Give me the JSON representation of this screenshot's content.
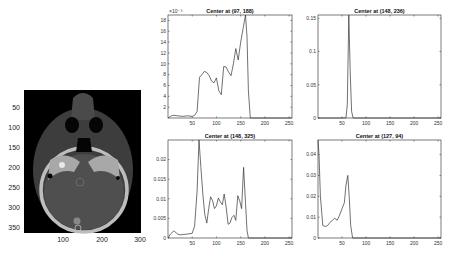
{
  "figure": {
    "image_panel": {
      "y_ticks": [
        "50",
        "100",
        "150",
        "200",
        "250",
        "300",
        "350"
      ],
      "x_ticks": [
        "100",
        "200",
        "300"
      ],
      "colormap": "gray",
      "bg_color": "#000000"
    },
    "line_color": "#333333",
    "axis_color": "#222222"
  },
  "chart_data": [
    {
      "type": "line",
      "title": "Center at (97, 188)",
      "exponent_label": "×10⁻³",
      "xlim": [
        0,
        256
      ],
      "ylim": [
        0,
        19
      ],
      "x_ticks": [
        "50",
        "100",
        "150",
        "200",
        "250"
      ],
      "y_ticks": [
        "2",
        "4",
        "6",
        "8",
        "10",
        "12",
        "14",
        "16",
        "18"
      ],
      "x": [
        0,
        5,
        10,
        20,
        30,
        40,
        50,
        55,
        60,
        65,
        70,
        75,
        80,
        85,
        90,
        95,
        100,
        105,
        110,
        115,
        120,
        125,
        130,
        135,
        140,
        145,
        150,
        155,
        160,
        163,
        166,
        170,
        175,
        180,
        200,
        256
      ],
      "values": [
        0,
        0.3,
        0.5,
        0.4,
        0.3,
        0.4,
        0.3,
        0.5,
        1.2,
        7.5,
        8,
        8.6,
        8.4,
        7.8,
        6.8,
        6.5,
        7.4,
        5,
        4.3,
        9.5,
        9.4,
        8.5,
        7.8,
        10,
        12.8,
        10.7,
        14,
        16.5,
        19,
        15,
        5,
        0,
        0,
        0,
        0,
        0
      ]
    },
    {
      "type": "line",
      "title": "Center at (148, 236)",
      "xlim": [
        0,
        256
      ],
      "ylim": [
        0,
        0.155
      ],
      "x_ticks": [
        "50",
        "100",
        "150",
        "200",
        "250"
      ],
      "y_ticks": [
        "0",
        "0.05",
        "0.1",
        "0.15"
      ],
      "x": [
        0,
        58,
        61,
        64,
        67,
        70,
        73,
        256
      ],
      "values": [
        0,
        0,
        0.02,
        0.155,
        0.07,
        0.01,
        0,
        0
      ]
    },
    {
      "type": "line",
      "title": "Center at (148, 325)",
      "xlim": [
        0,
        256
      ],
      "ylim": [
        0,
        0.025
      ],
      "x_ticks": [
        "50",
        "100",
        "150",
        "200",
        "250"
      ],
      "y_ticks": [
        "0",
        "0.005",
        "0.01",
        "0.015",
        "0.02"
      ],
      "x": [
        0,
        5,
        12,
        20,
        25,
        30,
        40,
        50,
        55,
        60,
        64,
        68,
        72,
        76,
        80,
        84,
        88,
        92,
        96,
        100,
        104,
        108,
        112,
        116,
        120,
        124,
        128,
        132,
        136,
        140,
        144,
        148,
        152,
        156,
        160,
        163,
        166,
        256
      ],
      "values": [
        0,
        0.001,
        0.0018,
        0.001,
        0.0008,
        0.0009,
        0.001,
        0.0012,
        0.003,
        0.012,
        0.025,
        0.018,
        0.011,
        0.006,
        0.0038,
        0.0075,
        0.0105,
        0.0095,
        0.0075,
        0.0082,
        0.0102,
        0.0092,
        0.0085,
        0.0112,
        0.008,
        0.0035,
        0.0038,
        0.0052,
        0.0058,
        0.0045,
        0.0108,
        0.0095,
        0.0075,
        0.018,
        0.009,
        0.002,
        0,
        0
      ]
    },
    {
      "type": "line",
      "title": "Center at (127, 94)",
      "xlim": [
        0,
        256
      ],
      "ylim": [
        0,
        0.047
      ],
      "x_ticks": [
        "50",
        "100",
        "150",
        "200",
        "250"
      ],
      "y_ticks": [
        "0",
        "0.01",
        "0.02",
        "0.03",
        "0.04"
      ],
      "x": [
        0,
        2,
        5,
        10,
        15,
        20,
        25,
        30,
        35,
        40,
        45,
        50,
        55,
        58,
        62,
        65,
        68,
        72,
        256
      ],
      "values": [
        0.047,
        0.04,
        0.02,
        0.006,
        0.0055,
        0.006,
        0.0075,
        0.0085,
        0.0095,
        0.0085,
        0.011,
        0.014,
        0.017,
        0.025,
        0.03,
        0.02,
        0.006,
        0,
        0
      ]
    }
  ]
}
